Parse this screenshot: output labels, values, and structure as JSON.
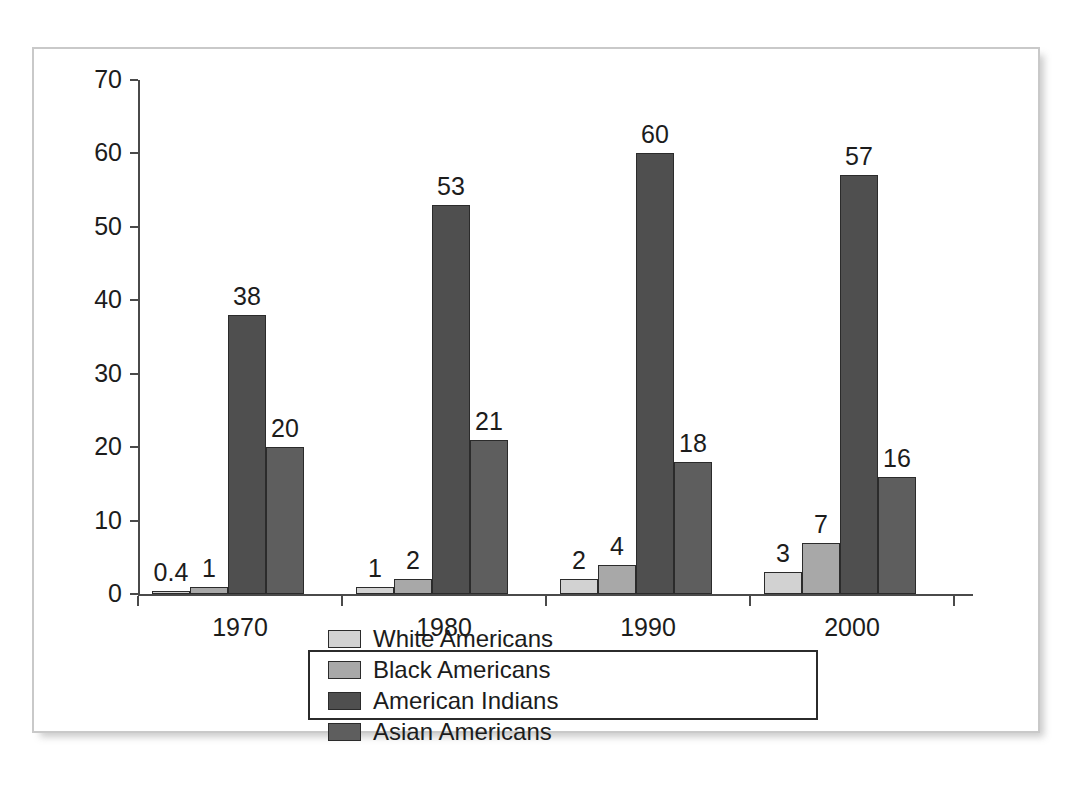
{
  "chart_data": {
    "type": "bar",
    "title": "",
    "subtitle": "",
    "xlabel": "",
    "ylabel": "",
    "categories": [
      "1970",
      "1980",
      "1990",
      "2000"
    ],
    "series": [
      {
        "name": "White Americans",
        "color": "#d2d2d2",
        "values": [
          0.4,
          1,
          2,
          3
        ],
        "labels": [
          "0.4",
          "1",
          "2",
          "3"
        ]
      },
      {
        "name": "Black Americans",
        "color": "#a8a8a8",
        "values": [
          1,
          2,
          4,
          7
        ],
        "labels": [
          "1",
          "2",
          "4",
          "7"
        ]
      },
      {
        "name": "American Indians",
        "color": "#4f4f4f",
        "values": [
          38,
          53,
          60,
          57
        ],
        "labels": [
          "38",
          "53",
          "60",
          "57"
        ]
      },
      {
        "name": "Asian Americans",
        "color": "#5e5e5e",
        "values": [
          20,
          21,
          18,
          16
        ],
        "labels": [
          "20",
          "21",
          "18",
          "16"
        ]
      }
    ],
    "ylim": [
      0,
      70
    ],
    "yticks": [
      0,
      10,
      20,
      30,
      40,
      50,
      60,
      70
    ],
    "ytick_labels": [
      "0",
      "10",
      "20",
      "30",
      "40",
      "50",
      "60",
      "70"
    ],
    "grid": false,
    "legend_position": "bottom",
    "axis_color": "#4a4a4a",
    "bar_border_color": "#2b2b2b",
    "frame_color": "#c9c9c9"
  }
}
